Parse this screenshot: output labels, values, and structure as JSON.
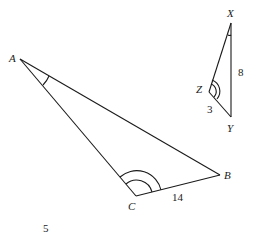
{
  "diagram": {
    "triangle_abc": {
      "vertices": {
        "A": "A",
        "B": "B",
        "C": "C"
      },
      "side_cb_length": "14",
      "angle_marks": {
        "A": "single arc",
        "C": "double arc"
      }
    },
    "triangle_xyz": {
      "vertices": {
        "X": "X",
        "Y": "Y",
        "Z": "Z"
      },
      "side_xy_length": "8",
      "side_zy_length": "3",
      "angle_marks": {
        "X": "single arc",
        "Z": "double arc"
      }
    },
    "page_number": "5"
  }
}
